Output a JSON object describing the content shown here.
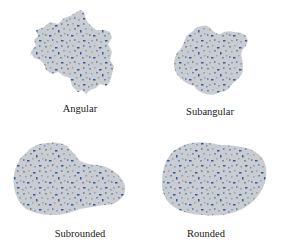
{
  "figure": {
    "fill_color": "#c9ccd1",
    "grain_color_dark": "#2f5a9e",
    "grain_color_mid": "#7a8aa6",
    "grain_color_light": "#9aa3b2",
    "panels": [
      {
        "label": "Angular"
      },
      {
        "label": "Subangular"
      },
      {
        "label": "Subrounded"
      },
      {
        "label": "Rounded"
      }
    ]
  }
}
